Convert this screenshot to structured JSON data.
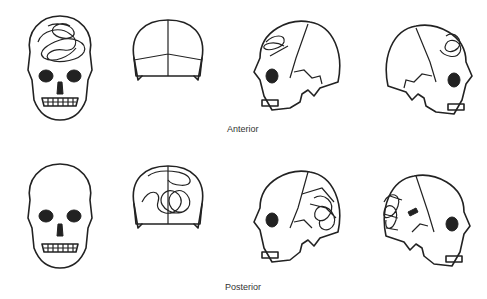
{
  "labels": {
    "anterior": "Anterior",
    "posterior": "Posterior"
  },
  "rows": [
    {
      "label": "Anterior",
      "views": [
        "front",
        "back",
        "left-lateral",
        "right-lateral"
      ],
      "fracture_region": "frontal"
    },
    {
      "label": "Posterior",
      "views": [
        "front",
        "back",
        "left-lateral",
        "right-lateral"
      ],
      "fracture_region": "occipital"
    }
  ],
  "colors": {
    "line": "#222222",
    "background": "#ffffff",
    "label": "#333333"
  }
}
